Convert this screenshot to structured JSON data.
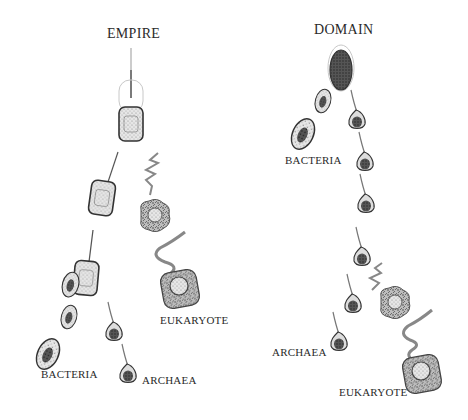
{
  "diagram": {
    "type": "two-panel phylogeny illustration",
    "panels": [
      {
        "title": "EMPIRE",
        "labels": [
          "BACTERIA",
          "ARCHAEA",
          "EUKARYOTE"
        ]
      },
      {
        "title": "DOMAIN",
        "labels": [
          "BACTERIA",
          "ARCHAEA",
          "EUKARYOTE"
        ]
      }
    ],
    "colors": {
      "ink": "#2a2a2a",
      "cell_fill": "#d9d9d9",
      "nucleus_dark": "#3a3a3a",
      "flagellum": "#8a8a8a"
    }
  }
}
